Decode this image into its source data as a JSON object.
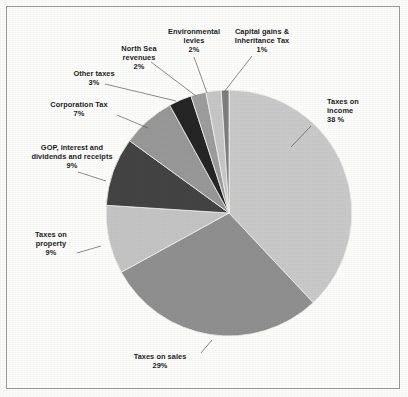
{
  "figure": {
    "background_color": "#fcfcfb",
    "border_color": "#9a9a9a",
    "label_color": "#1d1d1d"
  },
  "chart_data": {
    "type": "pie",
    "title": "",
    "subtitle": "",
    "xlabel": "",
    "ylabel": "",
    "legend_position": "none",
    "grid": false,
    "start_angle_deg": -90,
    "direction": "clockwise",
    "units": "percent of total tax receipts",
    "total": 100,
    "categories": [
      "Taxes on income",
      "Taxes on sales",
      "Taxes on property",
      "GOP, interest and dividends and receipts",
      "Corporation Tax",
      "Other taxes",
      "North Sea revenues",
      "Environmental levies",
      "Capital gains & Inheritance Tax"
    ],
    "values": [
      38,
      29,
      9,
      9,
      7,
      3,
      2,
      2,
      1
    ],
    "colors": [
      "#c9c9c9",
      "#8f8f8f",
      "#c4c4c4",
      "#434343",
      "#989898",
      "#252525",
      "#9d9d9d",
      "#c6c6c6",
      "#7d7d7d"
    ],
    "slices": [
      {
        "label": "Taxes on income",
        "value_text": "38 %",
        "value": 38,
        "color": "#c9c9c9",
        "label_lines": [
          "Taxes on",
          "income"
        ],
        "label_pos": "right"
      },
      {
        "label": "Taxes on sales",
        "value_text": "29%",
        "value": 29,
        "color": "#8f8f8f",
        "label_lines": [
          "Taxes on sales"
        ],
        "label_pos": "bottom"
      },
      {
        "label": "Taxes on property",
        "value_text": "9%",
        "value": 9,
        "color": "#c4c4c4",
        "label_lines": [
          "Taxes on",
          "property"
        ],
        "label_pos": "left"
      },
      {
        "label": "GOP, interest and dividends and receipts",
        "value_text": "9%",
        "value": 9,
        "color": "#434343",
        "label_lines": [
          "GOP, interest and",
          "dividends and receipts"
        ],
        "label_pos": "left"
      },
      {
        "label": "Corporation Tax",
        "value_text": "7%",
        "value": 7,
        "color": "#989898",
        "label_lines": [
          "Corporation Tax"
        ],
        "label_pos": "left"
      },
      {
        "label": "Other taxes",
        "value_text": "3%",
        "value": 3,
        "color": "#252525",
        "label_lines": [
          "Other taxes"
        ],
        "label_pos": "upper-left"
      },
      {
        "label": "North Sea revenues",
        "value_text": "2%",
        "value": 2,
        "color": "#9d9d9d",
        "label_lines": [
          "North Sea",
          "revenues"
        ],
        "label_pos": "top-left"
      },
      {
        "label": "Environmental levies",
        "value_text": "2%",
        "value": 2,
        "color": "#c6c6c6",
        "label_lines": [
          "Environmental",
          "levies"
        ],
        "label_pos": "top"
      },
      {
        "label": "Capital gains & Inheritance Tax",
        "value_text": "1%",
        "value": 1,
        "color": "#7d7d7d",
        "label_lines": [
          "Capital gains &",
          "Inheritance Tax"
        ],
        "label_pos": "top-right"
      }
    ]
  },
  "labels": {
    "taxes_on_income": {
      "line1": "Taxes on",
      "line2": "income",
      "value": "38 %"
    },
    "taxes_on_sales": {
      "line1": "Taxes on sales",
      "value": "29%"
    },
    "taxes_on_property": {
      "line1": "Taxes on",
      "line2": "property",
      "value": "9%"
    },
    "gop_interest": {
      "line1": "GOP, interest and",
      "line2": "dividends and receipts",
      "value": "9%"
    },
    "corporation_tax": {
      "line1": "Corporation Tax",
      "value": "7%"
    },
    "other_taxes": {
      "line1": "Other taxes",
      "value": "3%"
    },
    "north_sea": {
      "line1": "North Sea",
      "line2": "revenues",
      "value": "2%"
    },
    "environmental_levies": {
      "line1": "Environmental",
      "line2": "levies",
      "value": "2%"
    },
    "capital_gains": {
      "line1": "Capital gains &",
      "line2": "Inheritance Tax",
      "value": "1%"
    }
  }
}
